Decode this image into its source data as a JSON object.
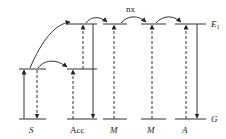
{
  "diagram": {
    "type": "energy-level-diagram",
    "colors": {
      "line": "#333333",
      "background": "#ffffff"
    },
    "level_labels": {
      "excited": "E",
      "excited_sub": "1",
      "ground": "G"
    },
    "transfer_label": "nx",
    "species": [
      {
        "id": "s",
        "label": "S"
      },
      {
        "id": "acc",
        "label": "Acc"
      },
      {
        "id": "m1",
        "label": "M"
      },
      {
        "id": "m2",
        "label": "M"
      },
      {
        "id": "a",
        "label": "A"
      }
    ]
  }
}
